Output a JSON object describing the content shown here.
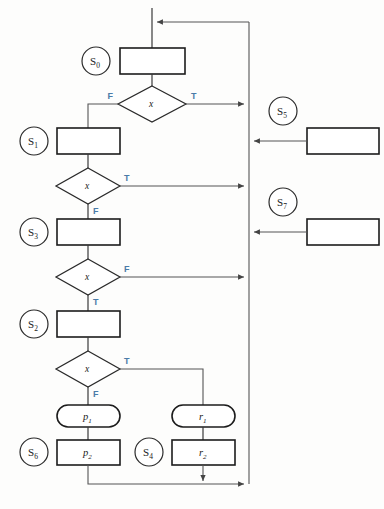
{
  "diagram": {
    "type": "flowchart",
    "condition_symbol": "x",
    "branch_true": "T",
    "branch_false": "F",
    "accent_color": "#4a7ba8",
    "line_color": "#555555",
    "shape_stroke": "#1c1c1c",
    "states": [
      {
        "name": "S0",
        "base": "S",
        "sub": "0"
      },
      {
        "name": "S1",
        "base": "S",
        "sub": "1"
      },
      {
        "name": "S3",
        "base": "S",
        "sub": "3"
      },
      {
        "name": "S2",
        "base": "S",
        "sub": "2"
      },
      {
        "name": "S6",
        "base": "S",
        "sub": "6"
      },
      {
        "name": "S4",
        "base": "S",
        "sub": "4"
      },
      {
        "name": "S5",
        "base": "S",
        "sub": "5"
      },
      {
        "name": "S7",
        "base": "S",
        "sub": "7"
      }
    ],
    "actions": [
      {
        "name": "p1",
        "base": "p",
        "sub": "1",
        "shape": "stadium"
      },
      {
        "name": "p2",
        "base": "p",
        "sub": "2",
        "shape": "rect"
      },
      {
        "name": "r1",
        "base": "r",
        "sub": "1",
        "shape": "stadium"
      },
      {
        "name": "r2",
        "base": "r",
        "sub": "2",
        "shape": "rect"
      }
    ],
    "decisions": [
      {
        "id": "d1",
        "label": "x",
        "left": "F",
        "right": "T"
      },
      {
        "id": "d2",
        "label": "x",
        "right": "T",
        "bottom": "F"
      },
      {
        "id": "d3",
        "label": "x",
        "right": "F",
        "bottom": "T"
      },
      {
        "id": "d4",
        "label": "x",
        "right": "T",
        "bottom": "F"
      }
    ]
  }
}
